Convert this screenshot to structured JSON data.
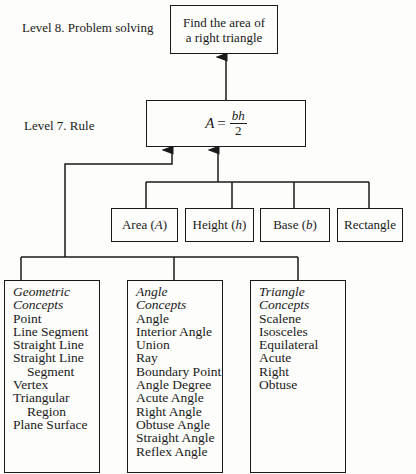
{
  "levels": {
    "level8_label": "Level 8.  Problem solving",
    "level7_label": "Level 7.  Rule"
  },
  "problem_box": {
    "line1": "Find the area of",
    "line2": "a right triangle"
  },
  "rule_box": {
    "lhs": "A",
    "equals": "=",
    "numerator": "bh",
    "denominator": "2"
  },
  "level6_concepts": [
    {
      "label": "Area",
      "symbol": "A"
    },
    {
      "label": "Height",
      "symbol": "h"
    },
    {
      "label": "Base",
      "symbol": "b"
    },
    {
      "label": "Rectangle",
      "symbol": ""
    }
  ],
  "concept_groups": [
    {
      "heading": [
        "Geometric",
        "Concepts"
      ],
      "items": [
        "Point",
        "Line Segment",
        "Straight Line",
        "Straight Line",
        "Segment",
        "Vertex",
        "Triangular",
        "Region",
        "Plane Surface"
      ],
      "indented": [
        4,
        7
      ]
    },
    {
      "heading": [
        "Angle",
        "Concepts"
      ],
      "items": [
        "Angle",
        "Interior Angle",
        "Union",
        "Ray",
        "Boundary Point",
        "Angle Degree",
        "Acute Angle",
        "Right Angle",
        "Obtuse Angle",
        "Straight Angle",
        "Reflex Angle"
      ],
      "indented": []
    },
    {
      "heading": [
        "Triangle",
        "Concepts"
      ],
      "items": [
        "Scalene",
        "Isosceles",
        "Equilateral",
        "Acute",
        "Right",
        "Obtuse"
      ],
      "indented": []
    }
  ]
}
